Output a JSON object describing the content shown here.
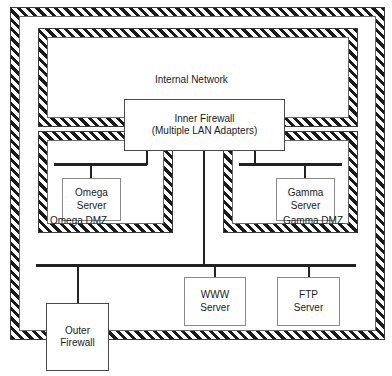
{
  "diagram": {
    "type": "network-topology",
    "canvas": {
      "width": 392,
      "height": 376
    },
    "colors": {
      "hatch_dark": "#1a1a1a",
      "hatch_light": "#ffffff",
      "cable": "#222222",
      "box_border": "#8a8a8a",
      "text": "#1b1b1b",
      "background": "#ffffff"
    }
  },
  "zones": {
    "perimeter": {
      "name": "outer-perimeter",
      "caption": "",
      "style": "hatched-boundary"
    },
    "internal_network": {
      "caption": "Internal Network",
      "style": "hatched-boundary"
    },
    "omega_dmz": {
      "caption": "Omega DMZ",
      "style": "hatched-boundary",
      "caption_align": "left"
    },
    "gamma_dmz": {
      "caption": "Gamma DMZ",
      "style": "hatched-boundary",
      "caption_align": "right"
    }
  },
  "nodes": {
    "inner_firewall": {
      "line1": "Inner Firewall",
      "line2": "(Multiple LAN Adapters)"
    },
    "omega_server": {
      "line1": "Omega",
      "line2": "Server"
    },
    "gamma_server": {
      "line1": "Gamma",
      "line2": "Server"
    },
    "www_server": {
      "line1": "WWW",
      "line2": "Server"
    },
    "ftp_server": {
      "line1": "FTP",
      "line2": "Server"
    },
    "outer_firewall": {
      "line1": "Outer",
      "line2": "Firewall"
    }
  },
  "cables": {
    "omega_bus": {
      "name": "omega-dmz-segment"
    },
    "gamma_bus": {
      "name": "gamma-dmz-segment"
    },
    "perimeter_bus": {
      "name": "perimeter-segment"
    }
  }
}
